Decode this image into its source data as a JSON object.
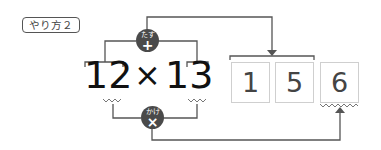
{
  "label": "やり方２",
  "expression": {
    "left_operand": "12",
    "operator": "×",
    "right_operand": "13"
  },
  "operations": {
    "add": {
      "label": "たす",
      "symbol": "+"
    },
    "multiply": {
      "label": "かけ",
      "symbol": "×"
    }
  },
  "answer_digits": [
    "1",
    "5",
    "6"
  ],
  "colors": {
    "line": "#555555",
    "circle": "#4a4a4a",
    "box_border": "#cfcfcf",
    "text": "#111111"
  }
}
